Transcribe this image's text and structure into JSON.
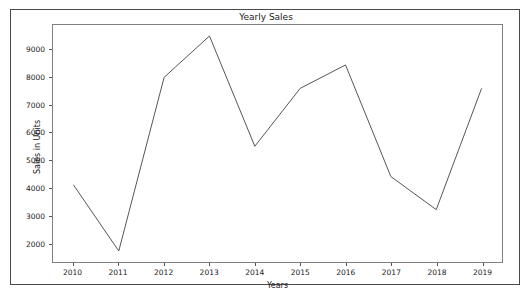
{
  "page": {
    "top_sliver_text": "",
    "background": "#ffffff"
  },
  "figure": {
    "border_color": "#4a4a4a",
    "axes_border_color": "#808080"
  },
  "chart_data": {
    "type": "line",
    "title": "Yearly Sales",
    "xlabel": "Years",
    "ylabel": "Sales in Units",
    "categories": [
      2010,
      2011,
      2012,
      2013,
      2014,
      2015,
      2016,
      2017,
      2018,
      2019
    ],
    "xticklabels": [
      "2010",
      "2011",
      "2012",
      "2013",
      "2014",
      "2015",
      "2016",
      "2017",
      "2018",
      "2019"
    ],
    "values": [
      4100,
      1700,
      8000,
      9500,
      5500,
      7600,
      8450,
      4400,
      3200,
      7600
    ],
    "series": [
      {
        "name": "Sales in Units",
        "color": "#555555",
        "values": [
          4100,
          1700,
          8000,
          9500,
          5500,
          7600,
          8450,
          4400,
          3200,
          7600
        ]
      }
    ],
    "yticks": [
      2000,
      3000,
      4000,
      5000,
      6000,
      7000,
      8000,
      9000
    ],
    "yticklabels": [
      "2000",
      "3000",
      "4000",
      "5000",
      "6000",
      "7000",
      "8000",
      "9000"
    ],
    "ylim": [
      1300,
      9900
    ],
    "xlim": [
      2009.55,
      2019.45
    ],
    "grid": false,
    "legend": false,
    "line_color": "#555555",
    "line_width": 1,
    "markers": false
  }
}
